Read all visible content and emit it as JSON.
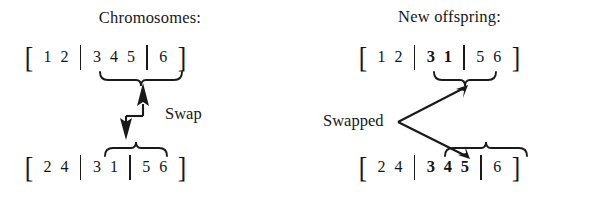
{
  "figure": {
    "name": "crossover-swap-diagram",
    "background": "#ffffff",
    "ink": "#1a1a1a"
  },
  "left_panel": {
    "title": "Chromosomes:",
    "rows": [
      {
        "id": "parent-a",
        "open_bracket": "[",
        "close_bracket": "]",
        "segments": [
          {
            "genes": [
              "1",
              "2"
            ],
            "bold": false
          },
          {
            "genes": [
              "3",
              "4",
              "5"
            ],
            "bold": false
          },
          {
            "genes": [
              "6"
            ],
            "bold": false
          }
        ]
      },
      {
        "id": "parent-b",
        "open_bracket": "[",
        "close_bracket": "]",
        "segments": [
          {
            "genes": [
              "2",
              "4"
            ],
            "bold": false
          },
          {
            "genes": [
              "3",
              "1"
            ],
            "bold": false
          },
          {
            "genes": [
              "5",
              "6"
            ],
            "bold": false
          }
        ]
      }
    ],
    "connector_label": "Swap",
    "brace_top": "underbrace-under-3-4-5",
    "brace_bottom": "overbrace-over-3-1"
  },
  "right_panel": {
    "title": "New offspring:",
    "rows": [
      {
        "id": "child-a",
        "open_bracket": "[",
        "close_bracket": "]",
        "segments": [
          {
            "genes": [
              "1",
              "2"
            ],
            "bold": false
          },
          {
            "genes": [
              "3",
              "1"
            ],
            "bold": true
          },
          {
            "genes": [
              "5",
              "6"
            ],
            "bold": false
          }
        ]
      },
      {
        "id": "child-b",
        "open_bracket": "[",
        "close_bracket": "]",
        "segments": [
          {
            "genes": [
              "2",
              "4"
            ],
            "bold": false
          },
          {
            "genes": [
              "3",
              "4",
              "5"
            ],
            "bold": true
          },
          {
            "genes": [
              "6"
            ],
            "bold": false
          }
        ]
      }
    ],
    "connector_label": "Swapped",
    "brace_top": "underbrace-under-3-1",
    "brace_bottom": "overbrace-over-3-4-5"
  }
}
